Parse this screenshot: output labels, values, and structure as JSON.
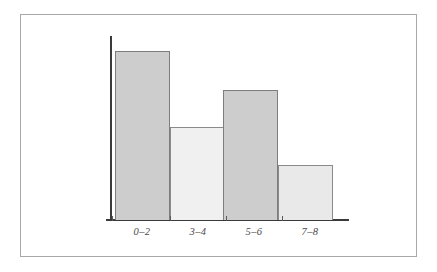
{
  "chart_data": {
    "type": "bar",
    "title": "",
    "subtitle": "",
    "xlabel": "",
    "ylabel": "",
    "categories": [
      "0–2",
      "3–4",
      "5–6",
      "7–8"
    ],
    "values": [
      169,
      93,
      130,
      55
    ],
    "ylim": [
      0,
      190
    ],
    "grid": false,
    "legend": null,
    "annotations": [],
    "bars": [
      {
        "label": "0–2",
        "value": 169,
        "x": 115,
        "width": 55,
        "top": 51,
        "height": 169,
        "fill": "#cdcdcd",
        "stroke": "#7d7d7d",
        "tick_x": 112,
        "label_center": 142
      },
      {
        "label": "3–4",
        "value": 93,
        "x": 170,
        "width": 55,
        "top": 127,
        "height": 93,
        "fill": "#f0f0f0",
        "stroke": "#8a8a8a",
        "tick_x": 170,
        "label_center": 198
      },
      {
        "label": "5–6",
        "value": 130,
        "x": 223,
        "width": 55,
        "top": 90,
        "height": 130,
        "fill": "#cdcdcd",
        "stroke": "#7d7d7d",
        "tick_x": 226,
        "label_center": 254
      },
      {
        "label": "7–8",
        "value": 55,
        "x": 278,
        "width": 55,
        "top": 165,
        "height": 55,
        "fill": "#e9e9e9",
        "stroke": "#8a8a8a",
        "tick_x": 282,
        "label_center": 310
      }
    ],
    "axes": {
      "axis_color": "#3a3a3a",
      "y_axis": {
        "x": 110,
        "top": 36,
        "height": 185
      },
      "x_axis": {
        "left": 106,
        "y": 219,
        "width": 243
      }
    },
    "frame": {
      "border_color": "#a8a8a8",
      "background": "#ffffff"
    }
  }
}
